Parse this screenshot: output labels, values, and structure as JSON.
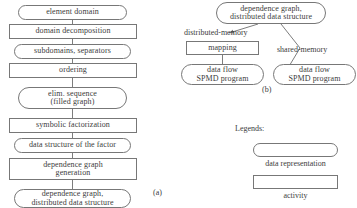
{
  "figure": {
    "pipeline_a": {
      "caption": "(a)",
      "nodes": [
        {
          "id": "element-domain",
          "kind": "data",
          "text": "element domain"
        },
        {
          "id": "domain-decomposition",
          "kind": "activity",
          "text": "domain decomposition"
        },
        {
          "id": "subdomains-separators",
          "kind": "data",
          "text": "subdomains, separators"
        },
        {
          "id": "ordering",
          "kind": "activity",
          "text": "ordering"
        },
        {
          "id": "elim-sequence",
          "kind": "data",
          "text": "elim. sequence\n(filled graph)"
        },
        {
          "id": "symbolic-factorization",
          "kind": "activity",
          "text": "symbolic factorization"
        },
        {
          "id": "data-structure-factor",
          "kind": "data",
          "text": "data structure of the factor"
        },
        {
          "id": "dependence-graph-generation",
          "kind": "activity",
          "text": "dependence graph\ngeneration"
        },
        {
          "id": "dependence-graph-distributed",
          "kind": "data",
          "text": "dependence graph,\ndistributed data structure"
        }
      ]
    },
    "pipeline_b": {
      "caption": "(b)",
      "root": {
        "id": "dependence-graph-distributed-b",
        "kind": "data",
        "text": "dependence graph,\ndistributed data structure"
      },
      "edge_labels": [
        {
          "id": "distributed-memory",
          "text": "distributed-memory"
        },
        {
          "id": "shared-memory",
          "text": "shared-memory"
        }
      ],
      "nodes": [
        {
          "id": "mapping",
          "kind": "activity",
          "text": "mapping"
        },
        {
          "id": "data-flow-spmd-left",
          "kind": "data",
          "text": "data flow\nSPMD program"
        },
        {
          "id": "data-flow-spmd-right",
          "kind": "data",
          "text": "data flow\nSPMD program"
        }
      ]
    },
    "legends": {
      "title": "Legends:",
      "items": [
        {
          "id": "legend-data-representation",
          "kind": "data",
          "caption": "data representation"
        },
        {
          "id": "legend-activity",
          "kind": "activity",
          "caption": "activity"
        }
      ]
    }
  },
  "style": {
    "stroke": "#7d7d7d",
    "text": "#3c3c3c",
    "background": "#ffffff"
  }
}
